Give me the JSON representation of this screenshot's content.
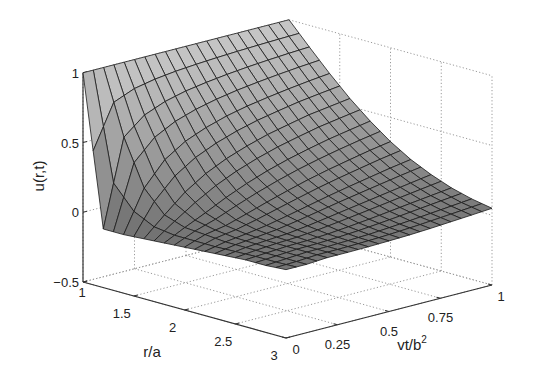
{
  "chart_data": {
    "type": "surface",
    "title": "",
    "xlabel": "r/a",
    "ylabel": "vt/b",
    "ylabel_superscript": "2",
    "zlabel": "u(r,t)",
    "x_ticks": [
      "1",
      "1.5",
      "2",
      "2.5",
      "3"
    ],
    "x_tick_values": [
      1,
      1.5,
      2,
      2.5,
      3
    ],
    "y_ticks": [
      "0",
      "0.25",
      "0.5",
      "0.75",
      "1"
    ],
    "y_tick_values": [
      0,
      0.25,
      0.5,
      0.75,
      1
    ],
    "z_ticks": [
      "−0.5",
      "0",
      "0.5",
      "1"
    ],
    "z_tick_values": [
      -0.5,
      0,
      0.5,
      1
    ],
    "xlim": [
      1,
      3
    ],
    "ylim": [
      0,
      1
    ],
    "zlim": [
      -0.5,
      1
    ],
    "grid": true,
    "grid_style": "dotted",
    "colormap": "gray",
    "r": [
      1.0,
      1.2,
      1.4,
      1.6,
      1.8,
      2.0,
      2.2,
      2.4,
      2.6,
      2.8,
      3.0
    ],
    "t": [
      0.0,
      0.1,
      0.2,
      0.3,
      0.4,
      0.5,
      0.6,
      0.7,
      0.8,
      0.9,
      1.0
    ],
    "u": [
      [
        1,
        -0.08,
        -0.08,
        -0.07,
        -0.06,
        -0.05,
        -0.04,
        -0.03,
        -0.02,
        -0.02,
        -0.01
      ],
      [
        1,
        0.54,
        0.215,
        0.063,
        0.013,
        0.002,
        -0.01,
        -0.01,
        -0.01,
        -0.01,
        -0.01
      ],
      [
        1,
        0.661,
        0.381,
        0.189,
        0.08,
        0.029,
        0.009,
        0.002,
        0,
        0,
        0
      ],
      [
        1,
        0.72,
        0.475,
        0.283,
        0.152,
        0.074,
        0.032,
        0.012,
        0.004,
        0.001,
        0
      ],
      [
        1,
        0.757,
        0.535,
        0.352,
        0.214,
        0.121,
        0.063,
        0.031,
        0.013,
        0.006,
        0.002
      ],
      [
        1,
        0.781,
        0.58,
        0.405,
        0.267,
        0.165,
        0.096,
        0.054,
        0.027,
        0.012,
        0.006
      ],
      [
        1,
        0.8,
        0.613,
        0.449,
        0.311,
        0.206,
        0.129,
        0.078,
        0.043,
        0.023,
        0.011
      ],
      [
        1,
        0.815,
        0.638,
        0.482,
        0.348,
        0.241,
        0.159,
        0.101,
        0.061,
        0.035,
        0.019
      ],
      [
        1,
        0.827,
        0.66,
        0.514,
        0.381,
        0.272,
        0.187,
        0.125,
        0.08,
        0.049,
        0.029
      ],
      [
        1,
        0.837,
        0.679,
        0.535,
        0.408,
        0.302,
        0.215,
        0.148,
        0.098,
        0.063,
        0.039
      ],
      [
        1,
        0.845,
        0.695,
        0.556,
        0.434,
        0.327,
        0.239,
        0.171,
        0.116,
        0.077,
        0.05
      ]
    ],
    "mesh_resolution": 20,
    "view": {
      "origin_px": [
        83,
        282
      ],
      "x_unit_px": [
        101.5,
        28
      ],
      "y_unit_px": [
        206,
        -53
      ],
      "z_unit_px": 139.5,
      "z_base": -0.5
    }
  },
  "colors": {
    "axis": "#333333",
    "grid": "#9a9a9a",
    "mesh_line": "#1a1a1a",
    "surface_light": "#c8c8c8",
    "surface_dark": "#3c3c3c"
  }
}
